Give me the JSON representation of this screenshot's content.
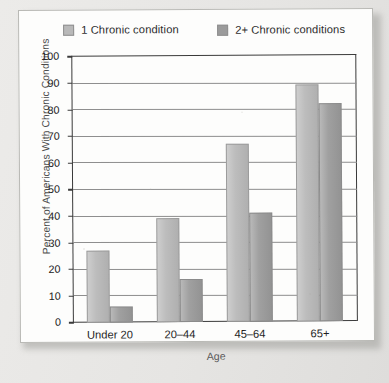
{
  "legend": {
    "items": [
      {
        "label": "1 Chronic condition",
        "color": "#b9b9b9"
      },
      {
        "label": "2+ Chronic conditions",
        "color": "#9b9b9b"
      }
    ]
  },
  "axes": {
    "y_ticks": [
      "100",
      "90",
      "80",
      "70",
      "60",
      "50",
      "40",
      "30",
      "20",
      "10",
      "0"
    ],
    "y_title": "Percent of Americans With Chronic Conditions",
    "x_title": "Age"
  },
  "chart_data": {
    "type": "bar",
    "title": "",
    "xlabel": "Age",
    "ylabel": "Percent of Americans With Chronic Conditions",
    "categories": [
      "Under 20",
      "20–44",
      "45–64",
      "65+"
    ],
    "series": [
      {
        "name": "1 Chronic condition",
        "color": "#b9b9b9",
        "values": [
          27,
          39,
          67,
          89
        ]
      },
      {
        "name": "2+ Chronic conditions",
        "color": "#9b9b9b",
        "values": [
          6,
          16,
          41,
          82
        ]
      }
    ],
    "ylim": [
      0,
      100
    ],
    "ytick_step": 10,
    "grid": true,
    "legend_position": "top"
  }
}
